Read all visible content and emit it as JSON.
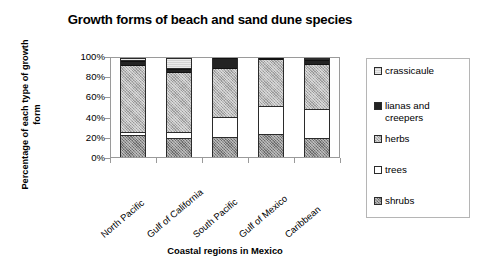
{
  "chart_data": {
    "type": "bar",
    "subtype": "stacked-100-percent",
    "title": "Growth forms of beach and sand dune species",
    "xlabel": "Coastal regions in Mexico",
    "ylabel": "Percentage of each type of growth form",
    "categories": [
      "North Pacific",
      "Gulf of California",
      "South Pacific",
      "Gulf of Mexico",
      "Caribbean"
    ],
    "ylim": [
      0,
      100
    ],
    "ytick_labels": [
      "0%",
      "20%",
      "40%",
      "60%",
      "80%",
      "100%"
    ],
    "ytick_values": [
      0,
      20,
      40,
      60,
      80,
      100
    ],
    "grid": false,
    "legend_position": "right",
    "stack_order_bottom_to_top": [
      "shrubs",
      "trees",
      "herbs",
      "lianas and creepers",
      "crassicaule"
    ],
    "series": [
      {
        "name": "shrubs",
        "color": "#8e8e8e",
        "values": [
          21,
          18,
          19,
          22,
          18
        ]
      },
      {
        "name": "trees",
        "color": "#ffffff",
        "values": [
          3,
          6,
          20,
          29,
          30
        ]
      },
      {
        "name": "herbs",
        "color": "#b4b4b4",
        "values": [
          68,
          61,
          50,
          47,
          46
        ]
      },
      {
        "name": "lianas and creepers",
        "color": "#232323",
        "values": [
          5,
          4,
          11,
          2,
          5
        ]
      },
      {
        "name": "crassicaule",
        "color": "#d2d2d2",
        "values": [
          3,
          11,
          0,
          0,
          1
        ]
      }
    ]
  },
  "legend": {
    "items": [
      {
        "label": "crassicaule",
        "swatch": "crassicaule-swatch"
      },
      {
        "label": "lianas and creepers",
        "swatch": "lianas-swatch"
      },
      {
        "label": "herbs",
        "swatch": "herbs-swatch"
      },
      {
        "label": "trees",
        "swatch": "trees-swatch"
      },
      {
        "label": "shrubs",
        "swatch": "shrubs-swatch"
      }
    ]
  }
}
